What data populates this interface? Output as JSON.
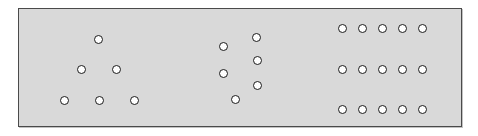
{
  "figure": {
    "title": "",
    "panel": {
      "x": 18,
      "y": 8,
      "width": 444,
      "height": 119,
      "background_color": "#d9d9d9",
      "border_color": "#4a4a4a"
    },
    "canvas": {
      "width": 478,
      "height": 136,
      "background_color": "#ffffff"
    },
    "marker": {
      "shape": "circle",
      "diameter": 9,
      "fill_color": "#ffffff",
      "stroke_color": "#1b1b1b",
      "stroke_width": 1.4
    },
    "total_markers": 27
  },
  "clusters": [
    {
      "name": "left-triangle-cluster",
      "label": "",
      "count": 6,
      "points": [
        {
          "x": 97,
          "y": 38
        },
        {
          "x": 80,
          "y": 68
        },
        {
          "x": 115,
          "y": 68
        },
        {
          "x": 63,
          "y": 99
        },
        {
          "x": 98,
          "y": 99
        },
        {
          "x": 133,
          "y": 99
        }
      ]
    },
    {
      "name": "middle-scatter-cluster",
      "label": "",
      "count": 6,
      "points": [
        {
          "x": 255,
          "y": 36
        },
        {
          "x": 222,
          "y": 45
        },
        {
          "x": 256,
          "y": 59
        },
        {
          "x": 222,
          "y": 72
        },
        {
          "x": 256,
          "y": 84
        },
        {
          "x": 234,
          "y": 98
        }
      ]
    },
    {
      "name": "right-grid-cluster",
      "label": "",
      "count": 15,
      "rows": 3,
      "columns": 5,
      "column_x": [
        341,
        361,
        381,
        401,
        421
      ],
      "row_y": [
        27,
        68,
        108
      ],
      "points": [
        {
          "x": 341,
          "y": 27
        },
        {
          "x": 361,
          "y": 27
        },
        {
          "x": 381,
          "y": 27
        },
        {
          "x": 401,
          "y": 27
        },
        {
          "x": 421,
          "y": 27
        },
        {
          "x": 341,
          "y": 68
        },
        {
          "x": 361,
          "y": 68
        },
        {
          "x": 381,
          "y": 68
        },
        {
          "x": 401,
          "y": 68
        },
        {
          "x": 421,
          "y": 68
        },
        {
          "x": 341,
          "y": 108
        },
        {
          "x": 361,
          "y": 108
        },
        {
          "x": 381,
          "y": 108
        },
        {
          "x": 401,
          "y": 108
        },
        {
          "x": 421,
          "y": 108
        }
      ]
    }
  ]
}
